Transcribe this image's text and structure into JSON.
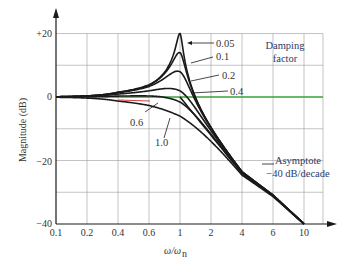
{
  "chart_data": {
    "type": "line",
    "title": "",
    "xlabel": "ω/ω_n",
    "ylabel": "Magnitude (dB)",
    "x_ticks": [
      "0.1",
      "0.2",
      "0.4",
      "0.6",
      "1",
      "2",
      "4",
      "6",
      "10"
    ],
    "x_tick_values": [
      0.1,
      0.2,
      0.4,
      0.6,
      1,
      2,
      4,
      6,
      10
    ],
    "y_ticks": [
      "+20",
      "0",
      "−20",
      "−40"
    ],
    "y_tick_values": [
      20,
      0,
      -20,
      -40
    ],
    "ylim": [
      -40,
      20
    ],
    "xlim": [
      0.1,
      10
    ],
    "grid": true,
    "legend_title": "Damping factor",
    "series": [
      {
        "name": "0.05",
        "zeta": 0.05,
        "peak_db": 20
      },
      {
        "name": "0.1",
        "zeta": 0.1,
        "peak_db": 14
      },
      {
        "name": "0.2",
        "zeta": 0.2,
        "peak_db": 8
      },
      {
        "name": "0.4",
        "zeta": 0.4,
        "peak_db": 2.5
      },
      {
        "name": "0.6",
        "zeta": 0.6,
        "peak_db": 0
      },
      {
        "name": "1.0",
        "zeta": 1.0,
        "peak_db": -6
      }
    ],
    "reference_line": {
      "name": "0 dB",
      "value": 0,
      "color": "#3aa03a"
    },
    "asymptote": {
      "label_line1": "Asymptote",
      "label_line2": "−40 dB/decade",
      "slope_db_per_decade": -40,
      "color": "#d04040"
    }
  },
  "labels": {
    "y_axis": "Magnitude (dB)",
    "x_axis_main": "ω/ω",
    "x_axis_sub": "n",
    "damping_line1": "Damping",
    "damping_line2": "factor",
    "asym_line1": "Asymptote",
    "asym_line2": "−40 dB/decade",
    "zeta_005": "0.05",
    "zeta_01": "0.1",
    "zeta_02": "0.2",
    "zeta_04": "0.4",
    "zeta_06": "0.6",
    "zeta_10": "1.0",
    "ytick_p20": "+20",
    "ytick_0": "0",
    "ytick_m20": "−20",
    "ytick_m40": "−40",
    "xt0": "0.1",
    "xt1": "0.2",
    "xt2": "0.4",
    "xt3": "0.6",
    "xt4": "1",
    "xt5": "2",
    "xt6": "4",
    "xt7": "6",
    "xt8": "10"
  },
  "colors": {
    "curve": "#1a1a1a",
    "grid": "#9a9a9a",
    "zero_line": "#3aa03a",
    "asymptote": "#d04040",
    "axis": "#1a1a1a"
  }
}
